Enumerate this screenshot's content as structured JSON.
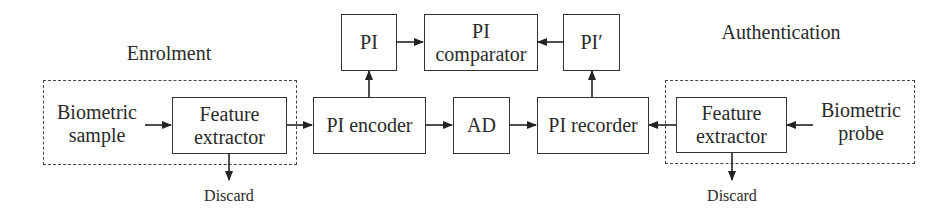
{
  "diagram": {
    "sections": {
      "enrolment": "Enrolment",
      "authentication": "Authentication"
    },
    "nodes": {
      "biometric_sample": [
        "Biometric",
        "sample"
      ],
      "feature_extractor_enrol": [
        "Feature",
        "extractor"
      ],
      "pi_encoder": "PI encoder",
      "ad": "AD",
      "pi_recorder": "PI recorder",
      "pi": "PI",
      "pi_comparator": [
        "PI",
        "comparator"
      ],
      "pi_prime": "PI′",
      "feature_extractor_auth": [
        "Feature",
        "extractor"
      ],
      "biometric_probe": [
        "Biometric",
        "probe"
      ],
      "discard_enrol": "Discard",
      "discard_auth": "Discard"
    },
    "edges": [
      [
        "Biometric sample",
        "Feature extractor (enrolment)"
      ],
      [
        "Feature extractor (enrolment)",
        "PI encoder"
      ],
      [
        "Feature extractor (enrolment)",
        "Discard"
      ],
      [
        "PI encoder",
        "PI"
      ],
      [
        "PI encoder",
        "AD"
      ],
      [
        "AD",
        "PI recorder"
      ],
      [
        "PI",
        "PI comparator"
      ],
      [
        "PI recorder",
        "PI′"
      ],
      [
        "PI′",
        "PI comparator"
      ],
      [
        "Feature extractor (authentication)",
        "PI recorder"
      ],
      [
        "Biometric probe",
        "Feature extractor (authentication)"
      ],
      [
        "Feature extractor (authentication)",
        "Discard"
      ]
    ]
  }
}
